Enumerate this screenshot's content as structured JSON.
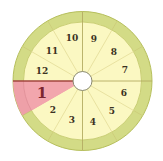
{
  "diagram": {
    "type": "astrological-houses-wheel",
    "center": [
      82.5,
      81
    ],
    "outer_radius": 70,
    "ring_inner_radius": 59,
    "hub_radius": 9.5,
    "highlighted_house": 1,
    "colors": {
      "ring": "#d3db86",
      "ring_border": "#b6bf5c",
      "fill": "#fbf8c2",
      "highlight": "#f2a6ad",
      "highlight_ring": "#eea0a8",
      "highlight_divider": "#a2463f",
      "divider": "#e6df9c",
      "axis": "#b9b36a",
      "hub": "#ffffff",
      "hub_border": "#8a8a70"
    },
    "houses": [
      {
        "number": "1",
        "start_deg": 180,
        "end_deg": 210
      },
      {
        "number": "2",
        "start_deg": 210,
        "end_deg": 240
      },
      {
        "number": "3",
        "start_deg": 240,
        "end_deg": 270
      },
      {
        "number": "4",
        "start_deg": 270,
        "end_deg": 300
      },
      {
        "number": "5",
        "start_deg": 300,
        "end_deg": 330
      },
      {
        "number": "6",
        "start_deg": 330,
        "end_deg": 360
      },
      {
        "number": "7",
        "start_deg": 0,
        "end_deg": 30
      },
      {
        "number": "8",
        "start_deg": 30,
        "end_deg": 60
      },
      {
        "number": "9",
        "start_deg": 60,
        "end_deg": 90
      },
      {
        "number": "10",
        "start_deg": 90,
        "end_deg": 120
      },
      {
        "number": "11",
        "start_deg": 120,
        "end_deg": 150
      },
      {
        "number": "12",
        "start_deg": 150,
        "end_deg": 180
      }
    ],
    "labels": {
      "h1": "1",
      "h2": "2",
      "h3": "3",
      "h4": "4",
      "h5": "5",
      "h6": "6",
      "h7": "7",
      "h8": "8",
      "h9": "9",
      "h10": "10",
      "h11": "11",
      "h12": "12"
    }
  }
}
